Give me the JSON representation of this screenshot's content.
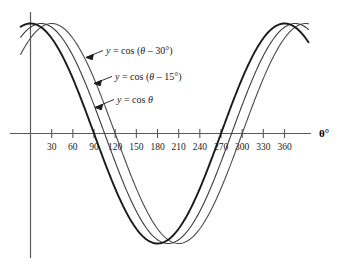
{
  "chart_data": {
    "type": "line",
    "title": "",
    "xlabel": "θ°",
    "ylabel": "",
    "xlim": [
      -20,
      395
    ],
    "ylim": [
      -1.18,
      1.18
    ],
    "grid": false,
    "legend_position": "inline-annotations",
    "x_ticks": [
      30,
      60,
      90,
      120,
      150,
      180,
      210,
      240,
      270,
      300,
      330,
      360
    ],
    "x_tick_labels": [
      "30",
      "60",
      "90",
      "120",
      "150",
      "180",
      "210",
      "240",
      "270",
      "300",
      "330",
      "360"
    ],
    "y_ticks": [],
    "y_tick_labels": [],
    "series": [
      {
        "name": "y = cos θ",
        "phase_shift_deg": 0,
        "amplitude": 1,
        "period_deg": 360,
        "color": "#1a1a1a",
        "line_width": 1.9,
        "key_points": [
          {
            "x": 0,
            "y": 1
          },
          {
            "x": 90,
            "y": 0
          },
          {
            "x": 180,
            "y": -1
          },
          {
            "x": 270,
            "y": 0
          },
          {
            "x": 360,
            "y": 1
          }
        ]
      },
      {
        "name": "y = cos (θ – 15°)",
        "phase_shift_deg": 15,
        "amplitude": 1,
        "period_deg": 360,
        "color": "#3b3b3b",
        "line_width": 1.1,
        "key_points": [
          {
            "x": 15,
            "y": 1
          },
          {
            "x": 105,
            "y": 0
          },
          {
            "x": 195,
            "y": -1
          },
          {
            "x": 285,
            "y": 0
          },
          {
            "x": 375,
            "y": 1
          }
        ]
      },
      {
        "name": "y = cos (θ – 30°)",
        "phase_shift_deg": 30,
        "amplitude": 1,
        "period_deg": 360,
        "color": "#4a4a4a",
        "line_width": 1.1,
        "key_points": [
          {
            "x": 30,
            "y": 1
          },
          {
            "x": 120,
            "y": 0
          },
          {
            "x": 210,
            "y": -1
          },
          {
            "x": 300,
            "y": 0
          },
          {
            "x": 390,
            "y": 1
          }
        ]
      }
    ],
    "annotations": [
      {
        "id": "label-cos-theta-minus-30",
        "text_parts": {
          "lhs": "y",
          "eq": " = cos (",
          "theta": "θ",
          "shift": " – 30°)"
        },
        "full_text": "y = cos (θ – 30°)",
        "points_to_series": "y = cos (θ – 30°)"
      },
      {
        "id": "label-cos-theta-minus-15",
        "text_parts": {
          "lhs": "y",
          "eq": " = cos (",
          "theta": "θ",
          "shift": " – 15°)"
        },
        "full_text": "y = cos (θ – 15°)",
        "points_to_series": "y = cos (θ – 15°)"
      },
      {
        "id": "label-cos-theta",
        "text_parts": {
          "lhs": "y",
          "eq": " = cos ",
          "theta": "θ",
          "shift": ""
        },
        "full_text": "y = cos θ",
        "points_to_series": "y = cos θ"
      }
    ]
  },
  "axis": {
    "x_axis_title": "θ°",
    "tick_labels": [
      "30",
      "60",
      "90",
      "120",
      "150",
      "180",
      "210",
      "240",
      "270",
      "300",
      "330",
      "360"
    ]
  },
  "labels": {
    "curve_30": {
      "a": "y",
      "b": " = cos (",
      "c": "θ",
      "d": " – 30°)"
    },
    "curve_15": {
      "a": "y",
      "b": " = cos (",
      "c": "θ",
      "d": " – 15°)"
    },
    "curve_0": {
      "a": "y",
      "b": " = cos ",
      "c": "θ",
      "d": ""
    }
  },
  "colors": {
    "axis": "#5a5a5a",
    "curve_main": "#1a1a1a",
    "curve_shift15": "#3b3b3b",
    "curve_shift30": "#4a4a4a",
    "text": "#1a1a1a",
    "background": "#ffffff"
  }
}
